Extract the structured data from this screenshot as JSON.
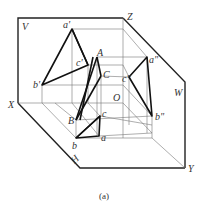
{
  "figure": {
    "caption": "(a)",
    "type": "three-view projection of a triangular pyramid in V-H-W projection planes",
    "planes": {
      "V": "V",
      "H": "H",
      "W": "W"
    },
    "axes": {
      "X": "X",
      "Y": "Y",
      "Z": "Z",
      "O": "O"
    },
    "space_points": {
      "A": "A",
      "B": "B",
      "C": "C"
    },
    "front_projection": {
      "a": "a'",
      "b": "b'",
      "c": "c'"
    },
    "top_projection": {
      "a": "a",
      "b": "b",
      "c": "c"
    },
    "side_projection": {
      "a": "a\"",
      "b": "b\"",
      "c": "c\""
    }
  },
  "colors": {
    "line": "#111111",
    "construction": "#777777",
    "text": "#333333"
  }
}
